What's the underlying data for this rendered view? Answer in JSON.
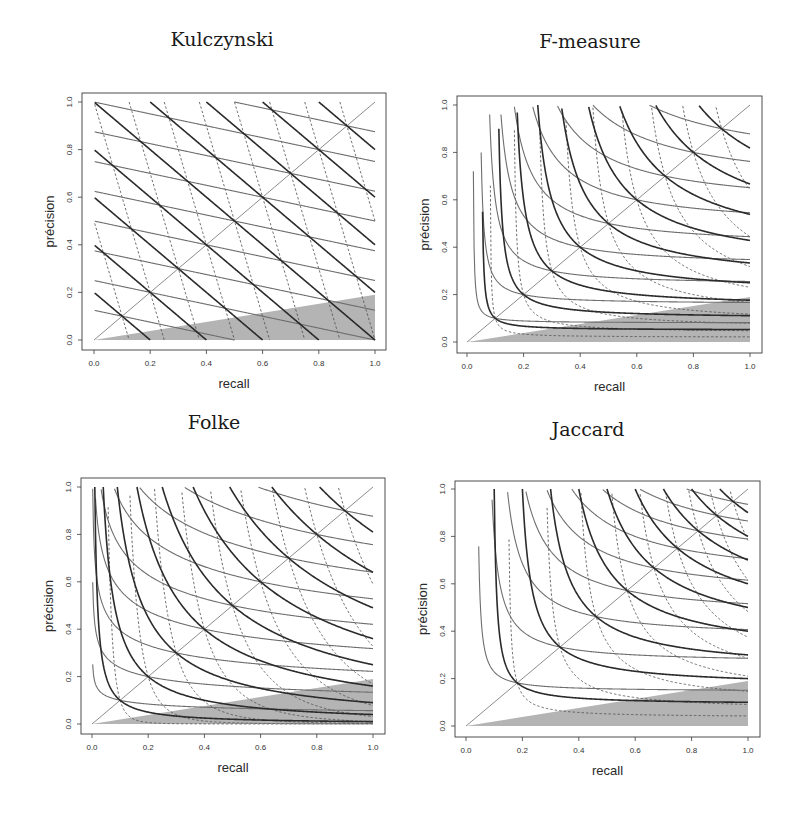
{
  "colors": {
    "thick": "#2b2b2b",
    "grey": "#6e6e6e",
    "dashed": "#4a4a4a",
    "diagonal": "#8c8c8c",
    "shade": "#b4b4b4",
    "frame": "#3a3a3a",
    "text": "#222222"
  },
  "chart_data": [
    {
      "type": "line",
      "title": "Kulczynski",
      "xlabel": "recall",
      "ylabel": "précision",
      "xlim": [
        0,
        1
      ],
      "ylim": [
        0,
        1
      ],
      "xticks": [
        "0.0",
        "0.2",
        "0.4",
        "0.6",
        "0.8",
        "1.0"
      ],
      "yticks": [
        "0.0",
        "0.2",
        "0.4",
        "0.6",
        "0.8",
        "1.0"
      ],
      "grid": false,
      "mean": "arithmetic",
      "levels": [
        0.1,
        0.2,
        0.3,
        0.4,
        0.5,
        0.6,
        0.7,
        0.8,
        0.9
      ],
      "series": [
        {
          "name": "balanced (w=1)",
          "weight": 1,
          "style": "thick"
        },
        {
          "name": "precision-weighted (w=4)",
          "weight": 4,
          "style": "grey"
        },
        {
          "name": "recall-weighted (w=1/4)",
          "weight": 0.25,
          "style": "dashed"
        }
      ],
      "diagonal": true,
      "shaded_region": [
        [
          0,
          0
        ],
        [
          1,
          0
        ],
        [
          1,
          0.19
        ]
      ],
      "frame": {
        "x": 82,
        "y": 93,
        "w": 304,
        "h": 257
      },
      "plot_area": {
        "x0": 94,
        "x1": 375,
        "y0": 340,
        "y1": 102
      },
      "title_pos": {
        "x": 222,
        "y": 40
      }
    },
    {
      "type": "line",
      "title": "F-measure",
      "xlabel": "recall",
      "ylabel": "précision",
      "xlim": [
        0,
        1
      ],
      "ylim": [
        0,
        1
      ],
      "xticks": [
        "0.0",
        "0.2",
        "0.4",
        "0.6",
        "0.8",
        "1.0"
      ],
      "yticks": [
        "0.0",
        "0.2",
        "0.4",
        "0.6",
        "0.8",
        "1.0"
      ],
      "grid": false,
      "mean": "harmonic",
      "levels": [
        0.1,
        0.2,
        0.3,
        0.4,
        0.5,
        0.6,
        0.7,
        0.8,
        0.9
      ],
      "series": [
        {
          "name": "balanced (w=1)",
          "weight": 1,
          "style": "thick"
        },
        {
          "name": "precision-weighted (w=4)",
          "weight": 4,
          "style": "grey"
        },
        {
          "name": "recall-weighted (w=1/4)",
          "weight": 0.25,
          "style": "dashed"
        }
      ],
      "diagonal": true,
      "shaded_region": [
        [
          0,
          0
        ],
        [
          1,
          0
        ],
        [
          1,
          0.19
        ]
      ],
      "frame": {
        "x": 457,
        "y": 96,
        "w": 305,
        "h": 257
      },
      "plot_area": {
        "x0": 467,
        "x1": 750,
        "y0": 342,
        "y1": 105
      },
      "title_pos": {
        "x": 590,
        "y": 42
      }
    },
    {
      "type": "line",
      "title": "Folke",
      "xlabel": "recall",
      "ylabel": "précision",
      "xlim": [
        0,
        1
      ],
      "ylim": [
        0,
        1
      ],
      "xticks": [
        "0.0",
        "0.2",
        "0.4",
        "0.6",
        "0.8",
        "1.0"
      ],
      "yticks": [
        "0.0",
        "0.2",
        "0.4",
        "0.6",
        "0.8",
        "1.0"
      ],
      "grid": false,
      "mean": "geometric",
      "levels": [
        0.1,
        0.2,
        0.3,
        0.4,
        0.5,
        0.6,
        0.7,
        0.8,
        0.9
      ],
      "series": [
        {
          "name": "balanced (w=1)",
          "weight": 1,
          "style": "thick"
        },
        {
          "name": "precision-weighted (w=4)",
          "weight": 4,
          "style": "grey"
        },
        {
          "name": "recall-weighted (w=1/4)",
          "weight": 0.25,
          "style": "dashed"
        }
      ],
      "diagonal": true,
      "shaded_region": [
        [
          0,
          0
        ],
        [
          1,
          0
        ],
        [
          1,
          0.19
        ]
      ],
      "frame": {
        "x": 81,
        "y": 478,
        "w": 304,
        "h": 256
      },
      "plot_area": {
        "x0": 92,
        "x1": 373,
        "y0": 724,
        "y1": 487
      },
      "title_pos": {
        "x": 214,
        "y": 423
      }
    },
    {
      "type": "line",
      "title": "Jaccard",
      "xlabel": "recall",
      "ylabel": "précision",
      "xlim": [
        0,
        1
      ],
      "ylim": [
        0,
        1
      ],
      "xticks": [
        "0.0",
        "0.2",
        "0.4",
        "0.6",
        "0.8",
        "1.0"
      ],
      "yticks": [
        "0.0",
        "0.2",
        "0.4",
        "0.6",
        "0.8",
        "1.0"
      ],
      "grid": false,
      "mean": "jaccard",
      "levels": [
        0.1,
        0.2,
        0.3,
        0.4,
        0.5,
        0.6,
        0.7,
        0.8,
        0.9
      ],
      "series": [
        {
          "name": "balanced (w=1)",
          "weight": 1,
          "style": "thick"
        },
        {
          "name": "precision-weighted (w=4)",
          "weight": 4,
          "style": "grey"
        },
        {
          "name": "recall-weighted (w=1/4)",
          "weight": 0.25,
          "style": "dashed"
        }
      ],
      "diagonal": true,
      "shaded_region": [
        [
          0,
          0
        ],
        [
          1,
          0
        ],
        [
          1,
          0.19
        ]
      ],
      "frame": {
        "x": 455,
        "y": 481,
        "w": 305,
        "h": 256
      },
      "plot_area": {
        "x0": 466,
        "x1": 748,
        "y0": 726,
        "y1": 489
      },
      "title_pos": {
        "x": 588,
        "y": 430
      }
    }
  ]
}
